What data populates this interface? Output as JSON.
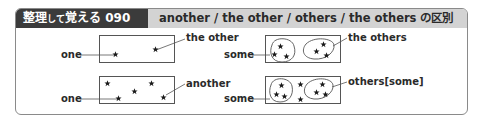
{
  "header": {
    "tag_main": "整理",
    "tag_small": "して",
    "tag_main2": "覚える",
    "tag_number": "090",
    "title": "another / the other / others / the others の区別"
  },
  "diagrams": [
    {
      "id": "the-other",
      "left_label": "one",
      "right_label": "the other",
      "description": "Two items: one and the other (the remaining one)"
    },
    {
      "id": "another",
      "left_label": "one",
      "right_label": "another",
      "description": "Several items: one and another (an unspecified additional one)"
    },
    {
      "id": "the-others",
      "left_label": "some",
      "right_label": "the others",
      "description": "Two groups: some and the others (all the rest)"
    },
    {
      "id": "others",
      "left_label": "some",
      "right_label": "others[some]",
      "description": "Some and others[some] with remaining stray items"
    }
  ],
  "colors": {
    "header_dark": "#3b3b3b",
    "header_light": "#d3d3d3",
    "border": "#8a8a8a",
    "text": "#2a2a2a"
  }
}
